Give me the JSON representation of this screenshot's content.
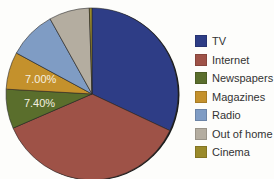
{
  "chart_data": {
    "type": "pie",
    "title": "",
    "categories": [
      "TV",
      "Internet",
      "Newspapers",
      "Magazines",
      "Radio",
      "Out of home",
      "Cinema"
    ],
    "values": [
      32.0,
      36.5,
      7.4,
      7.0,
      9.0,
      7.6,
      0.5
    ],
    "data_labels": [
      "",
      "",
      "7.40%",
      "7.00%",
      "",
      "",
      ""
    ],
    "colors": [
      "#2e3d86",
      "#9e5247",
      "#5a6e2c",
      "#c4912c",
      "#7f9cc4",
      "#b4ada0",
      "#9a8a2a"
    ],
    "start_angle_deg": 0,
    "direction": "clockwise",
    "legend_position": "right"
  },
  "legend": {
    "items": [
      {
        "label": "TV",
        "color": "#2e3d86"
      },
      {
        "label": "Internet",
        "color": "#9e5247"
      },
      {
        "label": "Newspapers",
        "color": "#5a6e2c"
      },
      {
        "label": "Magazines",
        "color": "#c4912c"
      },
      {
        "label": "Radio",
        "color": "#7f9cc4"
      },
      {
        "label": "Out of home",
        "color": "#b4ada0"
      },
      {
        "label": "Cinema",
        "color": "#9a8a2a"
      }
    ]
  }
}
